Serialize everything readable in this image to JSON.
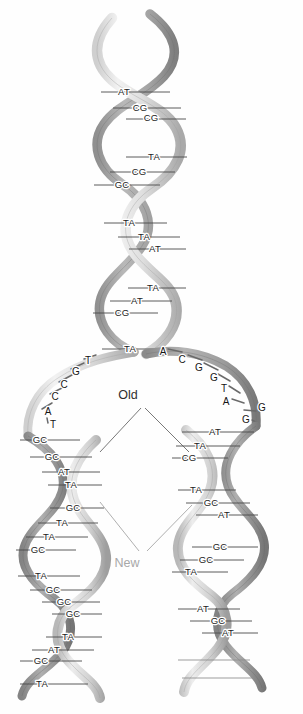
{
  "figure": {
    "background_color": "#fefefe"
  },
  "callouts": {
    "old": {
      "label": "Old",
      "color": "#2e2e2e",
      "x": 128,
      "y": 395
    },
    "new": {
      "label": "New",
      "color": "#a8a8a8",
      "x": 127,
      "y": 563
    }
  },
  "colors": {
    "ribbon_light": "#e4e4e4",
    "ribbon_mid": "#bdbdbd",
    "ribbon_dark": "#8f8f8f",
    "ribbon_darkest": "#6f6f6f",
    "rung_stroke": "#4a4a4a",
    "text": "#1c1c1c",
    "new_label": "#a8a8a8"
  },
  "parent_helix": {
    "name": "parent-double-helix",
    "region": "top",
    "base_pairs": [
      {
        "label": "AT",
        "x": 124,
        "y": 92
      },
      {
        "label": "CG",
        "x": 140,
        "y": 108
      },
      {
        "label": "CG",
        "x": 151,
        "y": 118
      },
      {
        "label": "TA",
        "x": 154,
        "y": 157
      },
      {
        "label": "CG",
        "x": 139,
        "y": 172
      },
      {
        "label": "GC",
        "x": 122,
        "y": 185
      },
      {
        "label": "TA",
        "x": 129,
        "y": 223
      },
      {
        "label": "TA",
        "x": 144,
        "y": 237
      },
      {
        "label": "AT",
        "x": 155,
        "y": 249
      },
      {
        "label": "TA",
        "x": 153,
        "y": 288
      },
      {
        "label": "AT",
        "x": 137,
        "y": 301
      },
      {
        "label": "CG",
        "x": 122,
        "y": 313
      },
      {
        "label": "TA",
        "x": 130,
        "y": 349
      }
    ]
  },
  "fork_left_unpaired": {
    "name": "left-unpaired-bases",
    "bases": [
      {
        "label": "T",
        "x": 88,
        "y": 361
      },
      {
        "label": "G",
        "x": 76,
        "y": 372
      },
      {
        "label": "C",
        "x": 64,
        "y": 385
      },
      {
        "label": "C",
        "x": 55,
        "y": 397
      },
      {
        "label": "A",
        "x": 48,
        "y": 412
      },
      {
        "label": "T",
        "x": 53,
        "y": 425
      }
    ]
  },
  "fork_right_unpaired": {
    "name": "right-unpaired-bases",
    "bases": [
      {
        "label": "A",
        "x": 163,
        "y": 352
      },
      {
        "label": "C",
        "x": 182,
        "y": 360
      },
      {
        "label": "G",
        "x": 199,
        "y": 368
      },
      {
        "label": "G",
        "x": 214,
        "y": 378
      },
      {
        "label": "T",
        "x": 224,
        "y": 389
      },
      {
        "label": "A",
        "x": 226,
        "y": 402
      },
      {
        "label": "G",
        "x": 262,
        "y": 408
      },
      {
        "label": "G",
        "x": 246,
        "y": 420
      }
    ]
  },
  "daughter_left": {
    "name": "left-daughter-helix",
    "base_pairs": [
      {
        "label": "GC",
        "x": 40,
        "y": 440
      },
      {
        "label": "GC",
        "x": 52,
        "y": 457
      },
      {
        "label": "AT",
        "x": 64,
        "y": 472
      },
      {
        "label": "TA",
        "x": 71,
        "y": 485
      },
      {
        "label": "GC",
        "x": 73,
        "y": 508
      },
      {
        "label": "TA",
        "x": 62,
        "y": 523
      },
      {
        "label": "TA",
        "x": 49,
        "y": 537
      },
      {
        "label": "GC",
        "x": 38,
        "y": 550
      },
      {
        "label": "TA",
        "x": 41,
        "y": 576
      },
      {
        "label": "GC",
        "x": 53,
        "y": 590
      },
      {
        "label": "GC",
        "x": 64,
        "y": 602
      },
      {
        "label": "GC",
        "x": 73,
        "y": 614
      },
      {
        "label": "TA",
        "x": 68,
        "y": 637
      },
      {
        "label": "AT",
        "x": 54,
        "y": 650
      },
      {
        "label": "GC",
        "x": 41,
        "y": 661
      },
      {
        "label": "TA",
        "x": 42,
        "y": 684
      }
    ]
  },
  "daughter_right": {
    "name": "right-daughter-helix",
    "base_pairs": [
      {
        "label": "AT",
        "x": 215,
        "y": 432
      },
      {
        "label": "TA",
        "x": 200,
        "y": 446
      },
      {
        "label": "CG",
        "x": 189,
        "y": 458
      },
      {
        "label": "TA",
        "x": 196,
        "y": 490
      },
      {
        "label": "GC",
        "x": 211,
        "y": 503
      },
      {
        "label": "AT",
        "x": 224,
        "y": 515
      },
      {
        "label": "GC",
        "x": 220,
        "y": 547
      },
      {
        "label": "GC",
        "x": 206,
        "y": 560
      },
      {
        "label": "TA",
        "x": 191,
        "y": 572
      },
      {
        "label": "AT",
        "x": 203,
        "y": 609
      },
      {
        "label": "GC",
        "x": 218,
        "y": 621
      },
      {
        "label": "AT",
        "x": 228,
        "y": 633
      }
    ]
  }
}
